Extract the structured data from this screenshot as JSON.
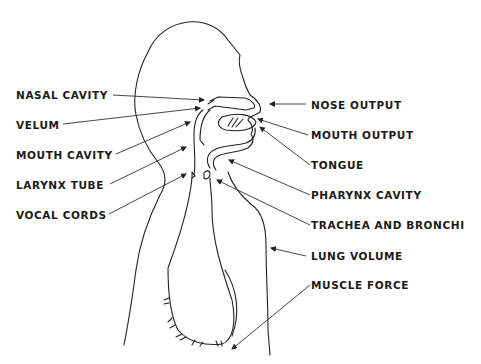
{
  "diagram": {
    "left_labels": [
      {
        "id": "nasal-cavity",
        "text": "NASAL CAVITY"
      },
      {
        "id": "velum",
        "text": "VELUM"
      },
      {
        "id": "mouth-cavity",
        "text": "MOUTH CAVITY"
      },
      {
        "id": "larynx-tube",
        "text": "LARYNX TUBE"
      },
      {
        "id": "vocal-cords",
        "text": "VOCAL CORDS"
      }
    ],
    "right_labels": [
      {
        "id": "nose-output",
        "text": "NOSE OUTPUT"
      },
      {
        "id": "mouth-output",
        "text": "MOUTH OUTPUT"
      },
      {
        "id": "tongue",
        "text": "TONGUE"
      },
      {
        "id": "pharynx-cavity",
        "text": "PHARYNX CAVITY"
      },
      {
        "id": "trachea-and-bronchi",
        "text": "TRACHEA AND BRONCHI"
      },
      {
        "id": "lung-volume",
        "text": "LUNG VOLUME"
      },
      {
        "id": "muscle-force",
        "text": "MUSCLE FORCE"
      }
    ],
    "colors": {
      "background": "#ffffff",
      "line": "#222222",
      "text": "#1a1a1a"
    }
  }
}
